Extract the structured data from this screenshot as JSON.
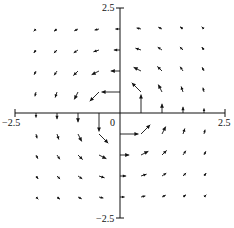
{
  "chart_data": {
    "type": "quiver",
    "title": "",
    "xlabel": "",
    "ylabel": "",
    "xlim": [
      -2.5,
      2.5
    ],
    "ylim": [
      -2.5,
      2.5
    ],
    "grid": false,
    "axes_through_origin": true,
    "tick_labels": {
      "x_min": "−2.5",
      "x_max": "2.5",
      "y_min": "−2.5",
      "y_max": "2.5",
      "origin": "0"
    },
    "field": {
      "description": "Counterclockwise rotational field decaying with distance, F(x,y) = (-y, x) / (x^2 + y^2)",
      "grid_x": [
        -2,
        -1.5,
        -1,
        -0.5,
        0,
        0.5,
        1,
        1.5,
        2
      ],
      "grid_y": [
        2,
        1.5,
        1,
        0.5,
        0,
        -0.5,
        -1,
        -1.5,
        -2
      ],
      "exponent": 2,
      "scale": 0.22,
      "max_len_px": 22
    },
    "colors": {
      "axis": "#111111",
      "arrow": "#111111",
      "background": "#ffffff"
    }
  }
}
